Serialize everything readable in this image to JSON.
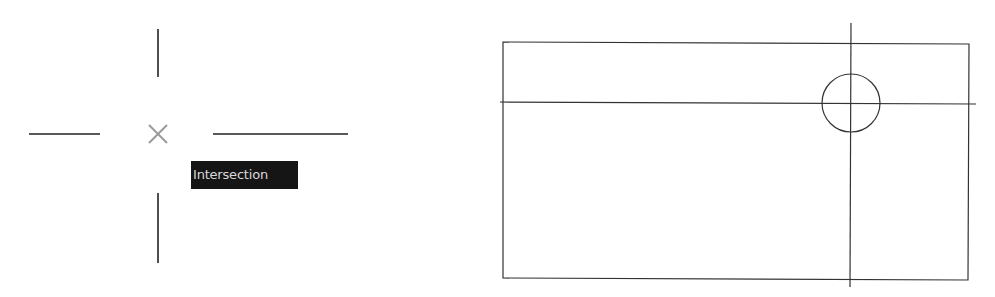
{
  "left_panel": {
    "crosshair": {
      "center": [
        158,
        134
      ],
      "vertical_top": [
        [
          158,
          29
        ],
        [
          158,
          77
        ]
      ],
      "vertical_bottom": [
        [
          158,
          193
        ],
        [
          158,
          263
        ]
      ],
      "horizontal_left": [
        [
          29,
          134
        ],
        [
          100,
          134
        ]
      ],
      "horizontal_right": [
        [
          213,
          134
        ],
        [
          348,
          134
        ]
      ],
      "line_color": "#222222"
    },
    "snap_marker": {
      "icon": "x-marker-icon",
      "color": "#9a9a9a",
      "size": 20
    },
    "tooltip": {
      "label": "Intersection",
      "background": "#151515",
      "text_color": "#d8d8d8"
    }
  },
  "right_panel": {
    "rectangle": {
      "corners": [
        [
          503,
          42
        ],
        [
          969,
          44
        ],
        [
          968,
          280
        ],
        [
          503,
          278
        ]
      ]
    },
    "horizontal_line": [
      [
        500,
        102
      ],
      [
        976,
        104
      ]
    ],
    "vertical_line": [
      [
        851,
        23
      ],
      [
        850,
        287
      ]
    ],
    "circle": {
      "center": [
        851,
        103
      ],
      "radius": 29
    },
    "line_color": "#333333"
  }
}
